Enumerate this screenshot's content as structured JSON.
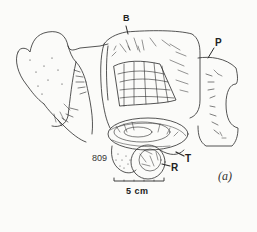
{
  "figure": {
    "panel_label": "(a)",
    "specimen_number": "809",
    "labels": {
      "B": "B",
      "P": "P",
      "T": "T",
      "R": "R"
    },
    "scale_bar": {
      "text": "5 cm"
    },
    "colors": {
      "ink": "#2a2a2a",
      "paper": "#fbfbf9"
    }
  }
}
